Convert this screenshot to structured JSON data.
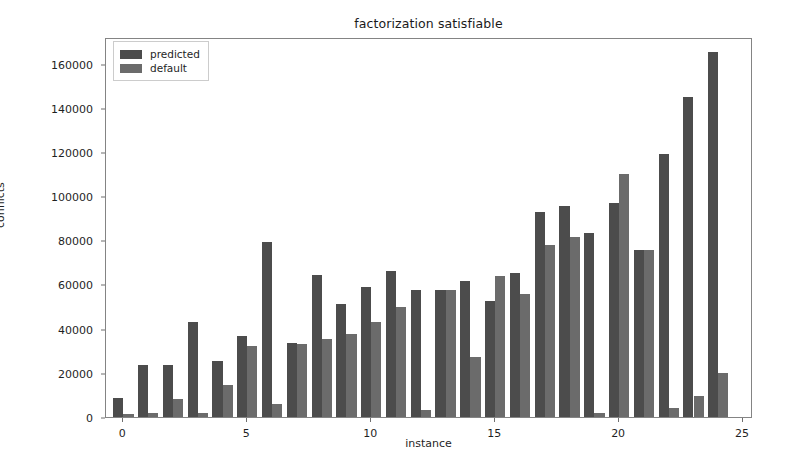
{
  "chart_data": {
    "type": "bar",
    "title": "factorization satisfiable",
    "xlabel": "instance",
    "ylabel": "conflicts",
    "grid": false,
    "legend_position": "upper left",
    "xlim": [
      -0.7,
      25.4
    ],
    "ylim": [
      0,
      172000
    ],
    "xticks": [
      0,
      5,
      10,
      15,
      20,
      25
    ],
    "xtick_labels": [
      "0",
      "5",
      "10",
      "15",
      "20",
      "25"
    ],
    "yticks": [
      0,
      20000,
      40000,
      60000,
      80000,
      100000,
      120000,
      140000,
      160000
    ],
    "ytick_labels": [
      "0",
      "20000",
      "40000",
      "60000",
      "80000",
      "100000",
      "120000",
      "140000",
      "160000"
    ],
    "categories": [
      0,
      1,
      2,
      3,
      4,
      5,
      6,
      7,
      8,
      9,
      10,
      11,
      12,
      13,
      14,
      15,
      16,
      17,
      18,
      19,
      20,
      21,
      22,
      23,
      24
    ],
    "series": [
      {
        "name": "predicted",
        "color": "#4c4c4c",
        "values": [
          8500,
          23500,
          23500,
          43000,
          25500,
          36500,
          79000,
          33500,
          64500,
          51000,
          59000,
          66000,
          57500,
          57500,
          61500,
          52500,
          65000,
          93000,
          95500,
          83500,
          97000,
          75500,
          119000,
          145000,
          165000
        ]
      },
      {
        "name": "default",
        "color": "#6b6b6b",
        "values": [
          1500,
          2000,
          8000,
          2000,
          14500,
          32000,
          6000,
          33000,
          35500,
          37500,
          43000,
          50000,
          3000,
          57500,
          27000,
          64000,
          55500,
          78000,
          81500,
          2000,
          110000,
          75500,
          4000,
          9500,
          20000
        ]
      }
    ]
  },
  "legend": {
    "entries": [
      {
        "label": "predicted",
        "swatch": "predicted-swatch"
      },
      {
        "label": "default",
        "swatch": "default-swatch"
      }
    ]
  }
}
